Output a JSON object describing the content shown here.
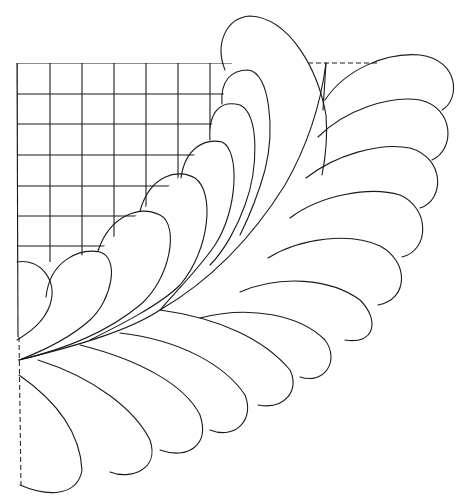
{
  "drawing": {
    "title": "Feathered corner quilting pattern with grid background",
    "stroke_color": "#1a1a1a",
    "background_color": "#ffffff",
    "grid": {
      "x_lines": [
        17,
        50,
        82,
        114,
        146,
        178,
        210,
        242
      ],
      "y_lines": [
        63,
        94,
        124,
        155,
        186,
        216,
        246
      ],
      "left": 17,
      "top": 63
    },
    "guides": {
      "top_dashed": "M 308 63 L 378 63",
      "left_dashed": "M 19 337 L 21 485"
    },
    "spine": "M 19 360 C 80 345 130 330 160 310 C 220 275 260 225 285 185 C 305 150 320 110 326 63",
    "stem": "M 326 63 L 323 110",
    "feathers_inner": [
      "M 17 262 C 40 258 58 280 50 305 C 44 322 30 332 17 340",
      "M 46 297 C 50 260 80 248 100 252 C 120 258 112 300 90 320 C 70 338 40 352 19 360",
      "M 98 251 C 110 215 140 205 160 215 C 180 225 170 280 140 305 C 110 330 70 348 19 360",
      "M 140 211 C 150 175 178 168 195 178 C 215 192 210 250 180 285 C 160 305 120 325 90 340",
      "M 181 178 C 185 148 205 138 222 142 C 240 150 238 210 215 245 C 198 270 175 292 160 310",
      "M 210 140 C 208 110 222 100 240 105 C 260 115 258 170 245 205 C 238 225 225 250 210 265",
      "M 222 104 C 220 80 232 70 248 70 C 270 72 275 130 265 170 C 258 195 250 215 240 235",
      "M 225 70 C 215 45 225 18 250 16 C 290 18 318 70 326 115 C 328 140 325 160 322 175"
    ],
    "feathers_outer": [
      "M 325 100 C 345 70 385 52 420 55 C 460 60 460 100 442 110",
      "M 318 137 C 345 110 390 95 420 100 C 455 108 455 150 432 160",
      "M 306 178 C 335 155 380 142 410 148 C 445 158 445 200 420 208",
      "M 290 218 C 320 195 370 186 400 195 C 430 208 430 250 402 257",
      "M 268 258 C 300 238 350 232 380 246 C 410 262 408 300 378 305",
      "M 240 292 C 280 275 330 278 360 300 C 380 320 375 345 345 340",
      "M 200 318 C 250 305 300 315 325 340 C 340 360 325 385 300 377",
      "M 160 310 C 220 318 265 340 290 370 C 300 390 285 410 258 405",
      "M 120 333 C 180 340 225 365 245 395 C 255 420 235 440 210 430",
      "M 80 345 C 140 360 185 385 200 415 C 210 445 188 460 160 450",
      "M 38 360 C 95 378 135 410 150 440 C 160 470 130 480 110 472",
      "M 19 375 C 55 400 80 430 82 470 C 78 495 50 498 20 485"
    ]
  }
}
